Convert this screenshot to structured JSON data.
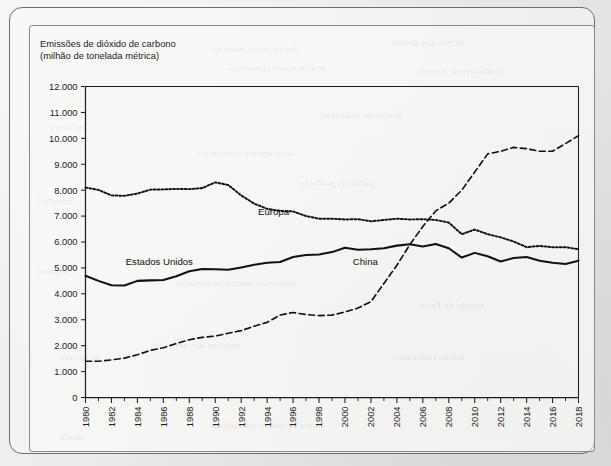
{
  "figure": {
    "title_line1": "Emissões de dióxido de carbono",
    "title_line2": "(milhão de tonelada métrica)",
    "title": "Emissões de dióxido de carbono\n(milhão de tonelada métrica)"
  },
  "chart_data": {
    "type": "line",
    "title": "Emissões de dióxido de carbono (milhão de tonelada métrica)",
    "xlabel": "",
    "ylabel": "milhão de tonelada métrica",
    "xlim": [
      1980,
      2018
    ],
    "ylim": [
      0,
      12000
    ],
    "ytick_step": 1000,
    "grid": false,
    "legend_position": "inline-labels",
    "ytick_labels": [
      "0",
      "1.000",
      "2.000",
      "3.000",
      "4.000",
      "5.000",
      "6.000",
      "7.000",
      "8.000",
      "9.000",
      "10.000",
      "11.000",
      "12.000"
    ],
    "ytick_values": [
      0,
      1000,
      2000,
      3000,
      4000,
      5000,
      6000,
      7000,
      8000,
      9000,
      10000,
      11000,
      12000
    ],
    "xtick_labels": [
      "1980",
      "1982",
      "1984",
      "1986",
      "1988",
      "1990",
      "1992",
      "1994",
      "1996",
      "1998",
      "2000",
      "2002",
      "2004",
      "2006",
      "2008",
      "2010",
      "2012",
      "2014",
      "2016",
      "2018"
    ],
    "xtick_values": [
      1980,
      1982,
      1984,
      1986,
      1988,
      1990,
      1992,
      1994,
      1996,
      1998,
      2000,
      2002,
      2004,
      2006,
      2008,
      2010,
      2012,
      2014,
      2016,
      2018
    ],
    "x": [
      1980,
      1981,
      1982,
      1983,
      1984,
      1985,
      1986,
      1987,
      1988,
      1989,
      1990,
      1991,
      1992,
      1993,
      1994,
      1995,
      1996,
      1997,
      1998,
      1999,
      2000,
      2001,
      2002,
      2003,
      2004,
      2005,
      2006,
      2007,
      2008,
      2009,
      2010,
      2011,
      2012,
      2013,
      2014,
      2015,
      2016,
      2017,
      2018
    ],
    "series": [
      {
        "name": "Estados Unidos",
        "style": "solid",
        "color": "#111111",
        "label_x": 1983.1,
        "label_y": 5120,
        "values": [
          4700,
          4500,
          4330,
          4320,
          4500,
          4520,
          4530,
          4680,
          4870,
          4960,
          4950,
          4930,
          5020,
          5120,
          5200,
          5230,
          5420,
          5500,
          5520,
          5610,
          5780,
          5700,
          5720,
          5760,
          5860,
          5910,
          5830,
          5920,
          5760,
          5400,
          5580,
          5450,
          5250,
          5380,
          5420,
          5280,
          5200,
          5150,
          5280
        ]
      },
      {
        "name": "Europa",
        "style": "dotted",
        "color": "#111111",
        "label_x": 1993.3,
        "label_y": 7050,
        "values": [
          8100,
          8010,
          7800,
          7780,
          7870,
          8020,
          8030,
          8050,
          8040,
          8080,
          8300,
          8200,
          7800,
          7480,
          7280,
          7200,
          7180,
          7000,
          6900,
          6900,
          6870,
          6880,
          6800,
          6850,
          6900,
          6870,
          6880,
          6850,
          6750,
          6300,
          6480,
          6300,
          6180,
          6020,
          5800,
          5850,
          5800,
          5800,
          5720
        ]
      },
      {
        "name": "China",
        "style": "dashed",
        "color": "#3f3f3f",
        "label_x": 2000.6,
        "label_y": 5100,
        "values": [
          1400,
          1400,
          1450,
          1520,
          1650,
          1820,
          1920,
          2080,
          2230,
          2320,
          2370,
          2480,
          2580,
          2750,
          2900,
          3180,
          3280,
          3200,
          3160,
          3180,
          3300,
          3450,
          3700,
          4400,
          5100,
          5900,
          6600,
          7200,
          7500,
          8000,
          8700,
          9400,
          9500,
          9650,
          9600,
          9500,
          9500,
          9800,
          10100
        ]
      }
    ],
    "annotations": []
  },
  "bleed_text": [
    {
      "x": 210,
      "y": 44,
      "text": "dos recursos naturais"
    },
    {
      "x": 392,
      "y": 37,
      "text": "de energia global"
    },
    {
      "x": 228,
      "y": 63,
      "text": "as alteracoes climaticas"
    },
    {
      "x": 418,
      "y": 66,
      "text": "combustiveis fosseis"
    },
    {
      "x": 50,
      "y": 122,
      "text": "em nivel"
    },
    {
      "x": 320,
      "y": 110,
      "text": "producao industrial"
    },
    {
      "x": 196,
      "y": 148,
      "text": "crescimento economico"
    },
    {
      "x": 38,
      "y": 196,
      "text": "mundial"
    },
    {
      "x": 300,
      "y": 178,
      "text": "politicas publicas"
    },
    {
      "x": 36,
      "y": 266,
      "text": "impacto"
    },
    {
      "x": 176,
      "y": 278,
      "text": "desenvolvimento sustentavel"
    },
    {
      "x": 420,
      "y": 300,
      "text": "acordo de Paris"
    },
    {
      "x": 150,
      "y": 340,
      "text": "reducao das emissoes"
    },
    {
      "x": 60,
      "y": 352,
      "text": "as nacoes"
    },
    {
      "x": 392,
      "y": 352,
      "text": "metas ambientais"
    },
    {
      "x": 210,
      "y": 420,
      "text": "fonte de dados estatisticos"
    },
    {
      "x": 60,
      "y": 432,
      "text": "tabela"
    }
  ]
}
